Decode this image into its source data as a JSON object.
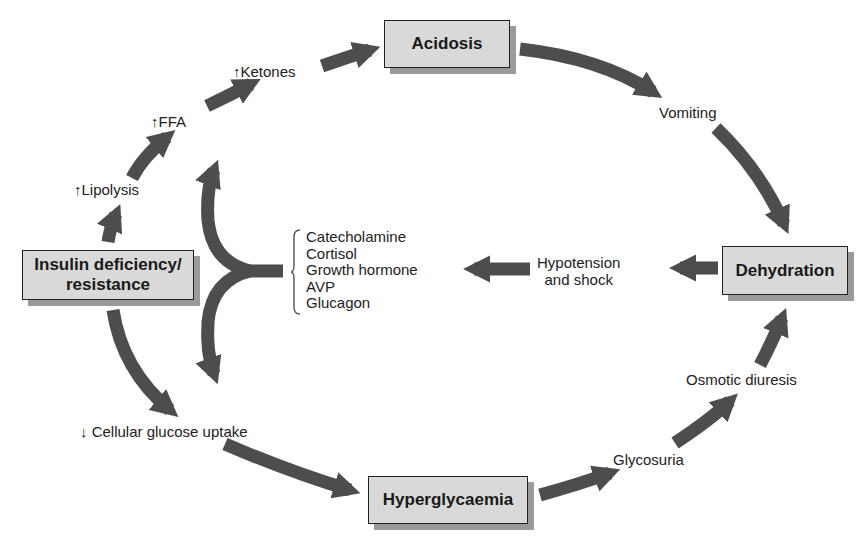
{
  "diagram": {
    "type": "flowchart-cycle",
    "colors": {
      "arrow_fill": "#4d4d4d",
      "box_fill": "#d9d9d9",
      "box_border": "#222222",
      "box_shadow": "#9a9a9a",
      "background": "#ffffff"
    },
    "boxes": {
      "insulin": "Insulin deficiency/ resistance",
      "acidosis": "Acidosis",
      "dehydration": "Dehydration",
      "hyperglycaemia": "Hyperglycaemia"
    },
    "labels": {
      "lipolysis": "↑Lipolysis",
      "ffa": "↑FFA",
      "ketones": "↑Ketones",
      "vomiting": "Vomiting",
      "hypotension_line1": "Hypotension",
      "hypotension_line2": "and shock",
      "osmotic_diuresis": "Osmotic diuresis",
      "glycosuria": "Glycosuria",
      "cellular_glucose": "↓ Cellular glucose uptake"
    },
    "hormones": [
      "Catecholamine",
      "Cortisol",
      "Growth hormone",
      "AVP",
      "Glucagon"
    ],
    "edges": [
      {
        "from": "Insulin deficiency/ resistance",
        "to": "↑Lipolysis"
      },
      {
        "from": "↑Lipolysis",
        "to": "↑FFA"
      },
      {
        "from": "↑FFA",
        "to": "↑Ketones"
      },
      {
        "from": "↑Ketones",
        "to": "Acidosis"
      },
      {
        "from": "Acidosis",
        "to": "Vomiting"
      },
      {
        "from": "Vomiting",
        "to": "Dehydration"
      },
      {
        "from": "Dehydration",
        "to": "Hypotension and shock"
      },
      {
        "from": "Hypotension and shock",
        "to": "Counter-regulatory hormones"
      },
      {
        "from": "Counter-regulatory hormones",
        "to": "↑FFA"
      },
      {
        "from": "Counter-regulatory hormones",
        "to": "↓ Cellular glucose uptake"
      },
      {
        "from": "Insulin deficiency/ resistance",
        "to": "↓ Cellular glucose uptake"
      },
      {
        "from": "↓ Cellular glucose uptake",
        "to": "Hyperglycaemia"
      },
      {
        "from": "Hyperglycaemia",
        "to": "Glycosuria"
      },
      {
        "from": "Glycosuria",
        "to": "Osmotic diuresis"
      },
      {
        "from": "Osmotic diuresis",
        "to": "Dehydration"
      }
    ]
  }
}
